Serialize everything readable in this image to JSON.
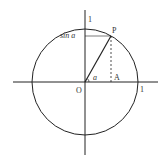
{
  "diagram": {
    "type": "unit-circle",
    "labels": {
      "origin": "O",
      "point_p": "P",
      "point_a": "A",
      "y_axis_one": "1",
      "x_axis_one": "1",
      "sin_label": "sin a",
      "angle": "a"
    },
    "colors": {
      "stroke": "#222222",
      "background": "#ffffff"
    }
  }
}
